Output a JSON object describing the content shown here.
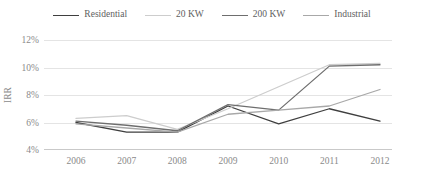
{
  "chart_data": {
    "type": "line",
    "title": "",
    "xlabel": "Year",
    "ylabel": "IRR",
    "categories": [
      "2006",
      "2007",
      "2008",
      "2009",
      "2010",
      "2011",
      "2012"
    ],
    "x": [
      2006,
      2007,
      2008,
      2009,
      2010,
      2011,
      2012
    ],
    "ylim": [
      4,
      12
    ],
    "yticks": [
      4,
      6,
      8,
      10,
      12
    ],
    "ytick_labels": [
      "4%",
      "6%",
      "8%",
      "10%",
      "12%"
    ],
    "y_unit": "%",
    "grid": true,
    "legend_position": "top",
    "series": [
      {
        "name": "Residential",
        "color": "#3f3f3f",
        "values": [
          6.0,
          5.3,
          5.3,
          7.2,
          5.9,
          7.0,
          6.1
        ]
      },
      {
        "name": "20 KW",
        "color": "#cdcdcd",
        "values": [
          6.3,
          6.5,
          5.5,
          7.0,
          8.6,
          10.2,
          10.3
        ]
      },
      {
        "name": "200 KW",
        "color": "#6e6e6e",
        "values": [
          6.1,
          5.8,
          5.4,
          7.3,
          6.9,
          10.1,
          10.2
        ]
      },
      {
        "name": "Industrial",
        "color": "#a8a8a8",
        "values": [
          5.9,
          5.6,
          5.3,
          6.6,
          6.9,
          7.2,
          8.4
        ]
      }
    ]
  },
  "legend": {
    "items": [
      {
        "label": "Residential",
        "color": "#3f3f3f"
      },
      {
        "label": "20 KW",
        "color": "#cdcdcd"
      },
      {
        "label": "200 KW",
        "color": "#6e6e6e"
      },
      {
        "label": "Industrial",
        "color": "#a8a8a8"
      }
    ]
  },
  "axes": {
    "y_title": "IRR",
    "x_title": "Year"
  }
}
